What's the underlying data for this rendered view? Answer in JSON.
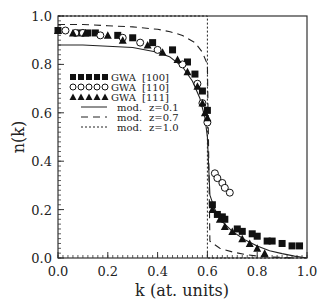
{
  "chart_data": {
    "type": "scatter",
    "title": "",
    "xlabel": "k (at. units)",
    "ylabel": "n(k)",
    "xlim": [
      0.0,
      1.0
    ],
    "ylim": [
      0.0,
      1.0
    ],
    "x_ticks": [
      "0.0",
      "0.2",
      "0.4",
      "0.6",
      "0.8",
      "1.0"
    ],
    "y_ticks": [
      "0.0",
      "0.2",
      "0.4",
      "0.6",
      "0.8",
      "1.0"
    ],
    "grid": false,
    "legend_position": "upper-left-inside",
    "legend": [
      {
        "label": "GWA",
        "direction": "[100]",
        "marker": "filled-square"
      },
      {
        "label": "GWA",
        "direction": "[110]",
        "marker": "open-circle"
      },
      {
        "label": "GWA",
        "direction": "[111]",
        "marker": "filled-triangle"
      },
      {
        "label": "mod.",
        "param": "z=0.1",
        "line": "solid"
      },
      {
        "label": "mod.",
        "param": "z=0.7",
        "line": "dashed"
      },
      {
        "label": "mod.",
        "param": "z=1.0",
        "line": "dotted"
      }
    ],
    "series": [
      {
        "name": "GWA [100]",
        "marker": "filled-square",
        "x": [
          0.0,
          0.09,
          0.12,
          0.15,
          0.24,
          0.3,
          0.38,
          0.46,
          0.52,
          0.55,
          0.58,
          0.6,
          0.62,
          0.64,
          0.66,
          0.67,
          0.72,
          0.74,
          0.78,
          0.8,
          0.84,
          0.86,
          0.9,
          0.94,
          0.97
        ],
        "y": [
          0.94,
          0.93,
          0.93,
          0.93,
          0.92,
          0.91,
          0.89,
          0.86,
          0.81,
          0.76,
          0.69,
          0.61,
          0.22,
          0.18,
          0.17,
          0.16,
          0.12,
          0.11,
          0.1,
          0.09,
          0.07,
          0.07,
          0.06,
          0.05,
          0.05
        ]
      },
      {
        "name": "GWA [110]",
        "marker": "open-circle",
        "x": [
          0.03,
          0.07,
          0.1,
          0.17,
          0.26,
          0.33,
          0.4,
          0.5,
          0.56,
          0.58,
          0.6,
          0.63,
          0.64,
          0.66,
          0.67,
          0.69
        ],
        "y": [
          0.94,
          0.93,
          0.93,
          0.92,
          0.91,
          0.89,
          0.86,
          0.8,
          0.72,
          0.64,
          0.56,
          0.35,
          0.33,
          0.31,
          0.29,
          0.27
        ]
      },
      {
        "name": "GWA [111]",
        "marker": "filled-triangle",
        "x": [
          0.0,
          0.06,
          0.11,
          0.2,
          0.26,
          0.36,
          0.42,
          0.48,
          0.52,
          0.56,
          0.58,
          0.59,
          0.6,
          0.62,
          0.65,
          0.67,
          0.7,
          0.74,
          0.77,
          0.8,
          0.83
        ],
        "y": [
          0.94,
          0.93,
          0.93,
          0.92,
          0.9,
          0.88,
          0.85,
          0.82,
          0.77,
          0.71,
          0.64,
          0.6,
          0.58,
          0.2,
          0.16,
          0.13,
          0.11,
          0.08,
          0.06,
          0.04,
          0.02
        ]
      },
      {
        "name": "mod. z=0.1",
        "line": "solid",
        "x": [
          0.0,
          0.1,
          0.2,
          0.3,
          0.4,
          0.45,
          0.5,
          0.54,
          0.57,
          0.59,
          0.6,
          0.61,
          0.63,
          0.66,
          0.7,
          0.75,
          0.8,
          0.85,
          0.9,
          0.95,
          1.0
        ],
        "y": [
          0.88,
          0.88,
          0.875,
          0.87,
          0.85,
          0.83,
          0.79,
          0.73,
          0.66,
          0.58,
          0.5,
          0.26,
          0.2,
          0.15,
          0.11,
          0.075,
          0.05,
          0.03,
          0.018,
          0.008,
          0.0
        ]
      },
      {
        "name": "mod. z=0.7",
        "line": "dashed",
        "x": [
          0.0,
          0.1,
          0.2,
          0.3,
          0.4,
          0.45,
          0.5,
          0.55,
          0.58,
          0.6,
          0.61,
          0.65,
          0.7,
          0.75,
          0.8,
          0.85,
          0.9,
          0.95
        ],
        "y": [
          0.965,
          0.965,
          0.96,
          0.955,
          0.945,
          0.935,
          0.92,
          0.89,
          0.85,
          0.8,
          0.07,
          0.04,
          0.025,
          0.015,
          0.008,
          0.004,
          0.002,
          0.0
        ]
      },
      {
        "name": "mod. z=1.0",
        "line": "dotted",
        "x": [
          0.0,
          0.6,
          0.6,
          1.0
        ],
        "y": [
          1.0,
          1.0,
          0.0,
          0.0
        ]
      }
    ]
  }
}
